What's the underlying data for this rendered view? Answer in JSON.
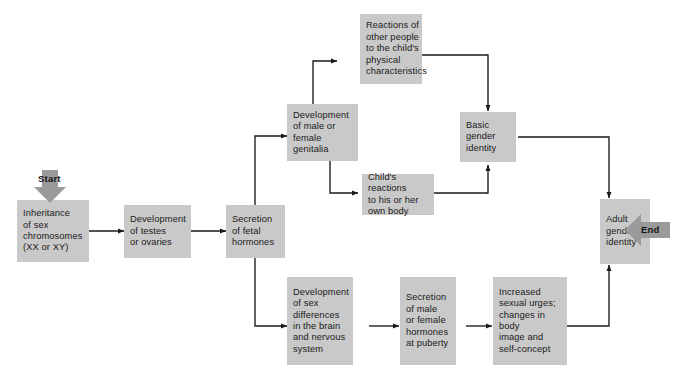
{
  "diagram": {
    "type": "flowchart",
    "palette": {
      "node_fill": "#c9c9c9",
      "terminal_fill": "#9a9a9a",
      "connector": "#1a1a1a",
      "text": "#1a1a1a",
      "background": "#ffffff"
    },
    "terminals": {
      "start": {
        "label": "Start",
        "direction": "down"
      },
      "end": {
        "label": "End",
        "direction": "left"
      }
    },
    "nodes": [
      {
        "id": "inheritance",
        "label": "Inheritance\nof sex\nchromosomes\n(XX or XY)"
      },
      {
        "id": "testes-ovaries",
        "label": "Development\nof testes\nor ovaries"
      },
      {
        "id": "fetal-hormones",
        "label": "Secretion\nof  fetal\nhormones"
      },
      {
        "id": "genitalia",
        "label": "Development\nof male or\nfemale\ngenitalia"
      },
      {
        "id": "reactions-others",
        "label": "Reactions of\nother people\nto the child's\nphysical\ncharacteristics"
      },
      {
        "id": "childs-reactions",
        "label": "Child's reactions\nto his or her\nown body"
      },
      {
        "id": "basic-gender",
        "label": "Basic\ngender\nidentity"
      },
      {
        "id": "brain-differences",
        "label": "Development\nof sex\ndifferences\nin the brain\nand nervous\nsystem"
      },
      {
        "id": "puberty-hormones",
        "label": "Secretion\nof male\nor female\nhormones\nat puberty"
      },
      {
        "id": "sexual-urges",
        "label": "Increased\nsexual urges;\nchanges in body\nimage and\nself-concept"
      },
      {
        "id": "adult-gender",
        "label": "Adult\ngender\nidentity"
      }
    ],
    "edges": [
      {
        "from": "start",
        "to": "inheritance"
      },
      {
        "from": "inheritance",
        "to": "testes-ovaries"
      },
      {
        "from": "testes-ovaries",
        "to": "fetal-hormones"
      },
      {
        "from": "fetal-hormones",
        "to": "genitalia"
      },
      {
        "from": "fetal-hormones",
        "to": "brain-differences"
      },
      {
        "from": "genitalia",
        "to": "reactions-others"
      },
      {
        "from": "genitalia",
        "to": "childs-reactions"
      },
      {
        "from": "reactions-others",
        "to": "basic-gender"
      },
      {
        "from": "childs-reactions",
        "to": "basic-gender"
      },
      {
        "from": "basic-gender",
        "to": "adult-gender"
      },
      {
        "from": "brain-differences",
        "to": "puberty-hormones"
      },
      {
        "from": "puberty-hormones",
        "to": "sexual-urges"
      },
      {
        "from": "sexual-urges",
        "to": "adult-gender"
      },
      {
        "from": "adult-gender",
        "to": "end"
      }
    ]
  }
}
